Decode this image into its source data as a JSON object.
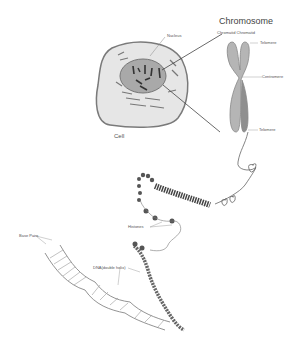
{
  "diagram": {
    "title": "Chromosome",
    "labels": {
      "nucleus": "Nucleus",
      "cell": "Cell",
      "chromatids": "Chromatid Chromatid",
      "telomere_top": "Telomere",
      "centromere": "Centromere",
      "telomere_bottom": "Telomere",
      "histones": "Histones",
      "base_pairs": "Base Pairs",
      "dna_helix": "DNA(double helix)"
    },
    "colors": {
      "background": "#ffffff",
      "cell_fill": "#e6e6e6",
      "cell_outline": "#7a7a7a",
      "nucleus_fill": "#a9a9a9",
      "chromosome_fill": "#b5b5b5",
      "ink": "#555555"
    }
  }
}
